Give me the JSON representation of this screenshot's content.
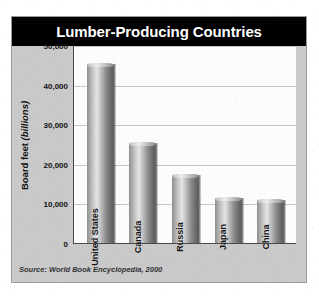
{
  "figure": {
    "title": "Lumber-Producing Countries",
    "source": "Source: World Book Encyclopedia, 2000",
    "frame_color": "#c9c9c9",
    "title_band_color": "#000000",
    "title_text_color": "#ffffff",
    "plot_background": "#fcfcfc",
    "gridline_color": "#c6c6c6",
    "axis_color": "#4a4a4a",
    "bar_color": "#9a9a9a"
  },
  "chart_data": {
    "type": "bar",
    "title": "Lumber-Producing Countries",
    "xlabel": "",
    "ylabel": "Board feet (billions)",
    "ylabel_main": "Board feet ",
    "ylabel_italic": "(billions)",
    "categories": [
      "United States",
      "Canada",
      "Russia",
      "Japan",
      "China"
    ],
    "values": [
      45000,
      25000,
      17000,
      11000,
      10500
    ],
    "ylim": [
      0,
      50000
    ],
    "yticks": [
      0,
      10000,
      20000,
      30000,
      40000,
      50000
    ],
    "ytick_labels": [
      "0",
      "10,000",
      "20,000",
      "30,000",
      "40,000",
      "50,000"
    ],
    "grid": true,
    "grid_axis": "y",
    "legend": false,
    "orientation": "vertical",
    "bar_label_rotation": -90,
    "source": "Source: World Book Encyclopedia, 2000"
  }
}
